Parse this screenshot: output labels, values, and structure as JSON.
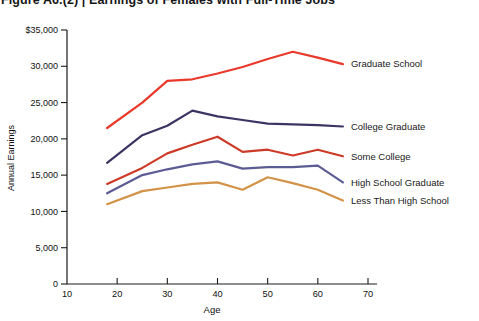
{
  "title": "Figure A6.(2) | Earnings of Females with Full-Time Jobs",
  "chart_data": {
    "type": "line",
    "title": "Earnings of Females with Full-Time Jobs",
    "xlabel": "Age",
    "ylabel": "Annual Earnings",
    "xlim": [
      10,
      70
    ],
    "ylim": [
      0,
      35000
    ],
    "grid": false,
    "legend_position": "labels-at-line-ends-right",
    "xticks": [
      10,
      20,
      30,
      40,
      50,
      60,
      70
    ],
    "ytick_values": [
      0,
      5000,
      10000,
      15000,
      20000,
      25000,
      30000,
      35000
    ],
    "ytick_labels": [
      "0",
      "5,000",
      "10,000",
      "15,000",
      "20,000",
      "25,000",
      "30,000",
      "$35,000"
    ],
    "x": [
      18,
      25,
      30,
      35,
      40,
      45,
      50,
      55,
      60,
      65
    ],
    "series": [
      {
        "name": "Graduate School",
        "color": "#e8392b",
        "values": [
          21500,
          25000,
          28000,
          28200,
          29000,
          29900,
          31000,
          32000,
          31200,
          30300
        ]
      },
      {
        "name": "College Graduate",
        "color": "#3a3563",
        "values": [
          16700,
          20500,
          21800,
          23900,
          23100,
          22600,
          22100,
          22000,
          21900,
          21700
        ]
      },
      {
        "name": "Some College",
        "color": "#cd3a28",
        "values": [
          13800,
          16000,
          18000,
          19200,
          20300,
          18200,
          18500,
          17700,
          18500,
          17600
        ]
      },
      {
        "name": "High School Graduate",
        "color": "#5c5c94",
        "values": [
          12500,
          15000,
          15800,
          16500,
          16900,
          15900,
          16100,
          16100,
          16300,
          14000
        ]
      },
      {
        "name": "Less Than High School",
        "color": "#d29348",
        "values": [
          11000,
          12800,
          13300,
          13800,
          14000,
          13000,
          14700,
          13900,
          13000,
          11500
        ]
      }
    ],
    "axis_color": "#1c1c1c",
    "text_color": "#111111"
  }
}
